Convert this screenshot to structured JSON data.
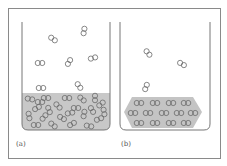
{
  "figure": {
    "colors": {
      "background": "#ffffff",
      "frame": "#8a8a8a",
      "beaker": "#777777",
      "liquid": "#c8c8c8",
      "solid": "#c4c4c4",
      "molecule_stroke": "#6a6a6a"
    },
    "panels": [
      {
        "id": "a",
        "label": "(a)",
        "phase": "liquid",
        "gas_molecule_count": 7,
        "condensed_molecule_count": 26
      },
      {
        "id": "b",
        "label": "(b)",
        "phase": "solid",
        "gas_molecule_count": 3,
        "condensed_molecule_count": 14
      }
    ]
  }
}
